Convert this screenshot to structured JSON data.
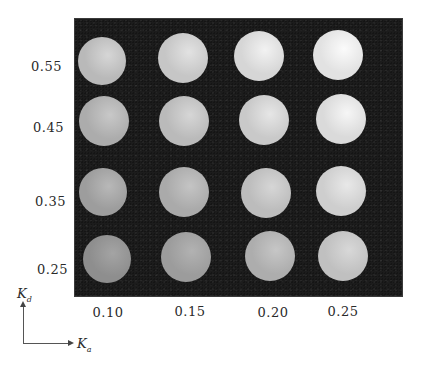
{
  "figure": {
    "panel_color": "#1c1c1c",
    "y_axis": {
      "symbol": "K",
      "subscript": "d",
      "ticks": [
        "0.55",
        "0.45",
        "0.35",
        "0.25"
      ]
    },
    "x_axis": {
      "symbol": "K",
      "subscript": "a",
      "ticks": [
        "0.10",
        "0.15",
        "0.20",
        "0.25"
      ]
    },
    "grid": {
      "rows": [
        {
          "kd": "0.55",
          "spheres": [
            {
              "ka": "0.10",
              "cx": 102,
              "cy": 61,
              "r": 24,
              "shade": "#b9b9b9",
              "highlight": "#d6d6d6"
            },
            {
              "ka": "0.15",
              "cx": 183,
              "cy": 58,
              "r": 25,
              "shade": "#c6c6c6",
              "highlight": "#e2e2e2"
            },
            {
              "ka": "0.20",
              "cx": 259,
              "cy": 56,
              "r": 25,
              "shade": "#d6d6d6",
              "highlight": "#f2f2f2"
            },
            {
              "ka": "0.25",
              "cx": 338,
              "cy": 55,
              "r": 25,
              "shade": "#e2e2e2",
              "highlight": "#fbfbfb"
            }
          ]
        },
        {
          "kd": "0.45",
          "spheres": [
            {
              "ka": "0.10",
              "cx": 104,
              "cy": 121,
              "r": 25,
              "shade": "#acacac",
              "highlight": "#c8c8c8"
            },
            {
              "ka": "0.15",
              "cx": 184,
              "cy": 121,
              "r": 25,
              "shade": "#bababa",
              "highlight": "#d6d6d6"
            },
            {
              "ka": "0.20",
              "cx": 264,
              "cy": 120,
              "r": 25,
              "shade": "#c9c9c9",
              "highlight": "#e6e6e6"
            },
            {
              "ka": "0.25",
              "cx": 341,
              "cy": 119,
              "r": 25,
              "shade": "#dadada",
              "highlight": "#f6f6f6"
            }
          ]
        },
        {
          "kd": "0.35",
          "spheres": [
            {
              "ka": "0.10",
              "cx": 103,
              "cy": 192,
              "r": 24,
              "shade": "#9d9d9d",
              "highlight": "#b8b8b8"
            },
            {
              "ka": "0.15",
              "cx": 184,
              "cy": 192,
              "r": 25,
              "shade": "#aaaaaa",
              "highlight": "#c4c4c4"
            },
            {
              "ka": "0.20",
              "cx": 266,
              "cy": 193,
              "r": 25,
              "shade": "#bcbcbc",
              "highlight": "#d6d6d6"
            },
            {
              "ka": "0.25",
              "cx": 341,
              "cy": 191,
              "r": 25,
              "shade": "#cecece",
              "highlight": "#e8e8e8"
            }
          ]
        },
        {
          "kd": "0.25",
          "spheres": [
            {
              "ka": "0.10",
              "cx": 107,
              "cy": 259,
              "r": 24,
              "shade": "#8e8e8e",
              "highlight": "#a4a4a4"
            },
            {
              "ka": "0.15",
              "cx": 186,
              "cy": 257,
              "r": 25,
              "shade": "#9c9c9c",
              "highlight": "#b2b2b2"
            },
            {
              "ka": "0.20",
              "cx": 270,
              "cy": 256,
              "r": 25,
              "shade": "#adadad",
              "highlight": "#c6c6c6"
            },
            {
              "ka": "0.25",
              "cx": 343,
              "cy": 256,
              "r": 25,
              "shade": "#c0c0c0",
              "highlight": "#d8d8d8"
            }
          ]
        }
      ]
    }
  }
}
